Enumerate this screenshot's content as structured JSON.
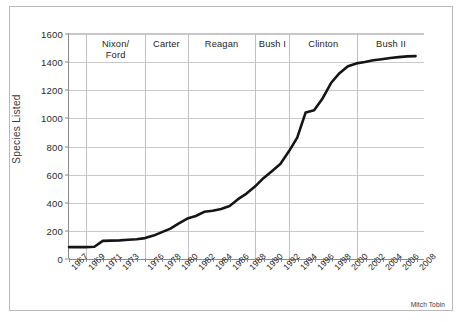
{
  "credit": "Mitch Tobin",
  "chart_data": {
    "type": "line",
    "title": "",
    "xlabel": "",
    "ylabel": "Species Listed",
    "ylim": [
      0,
      1600
    ],
    "ytick_labels": [
      "0",
      "200",
      "400",
      "600",
      "800",
      "1000",
      "1200",
      "1400",
      "1600"
    ],
    "ytick_values": [
      0,
      200,
      400,
      600,
      800,
      1000,
      1200,
      1400,
      1600
    ],
    "xtick_labels": [
      "1967",
      "1969",
      "1971",
      "1973",
      "1976",
      "1978",
      "1980",
      "1982",
      "1984",
      "1986",
      "1988",
      "1990",
      "1992",
      "1994",
      "1996",
      "1998",
      "2000",
      "2002",
      "2004",
      "2006",
      "2008"
    ],
    "grid": true,
    "legend": "none",
    "line_color": "#151515",
    "x": [
      1967,
      1968,
      1969,
      1970,
      1971,
      1972,
      1973,
      1974,
      1975,
      1976,
      1977,
      1978,
      1979,
      1980,
      1981,
      1982,
      1983,
      1984,
      1985,
      1986,
      1987,
      1988,
      1989,
      1990,
      1991,
      1992,
      1993,
      1994,
      1995,
      1996,
      1997,
      1998,
      1999,
      2000,
      2001,
      2002,
      2003,
      2004,
      2005,
      2006,
      2007,
      2008
    ],
    "values": [
      78,
      78,
      78,
      80,
      122,
      124,
      126,
      130,
      134,
      142,
      160,
      185,
      210,
      248,
      282,
      300,
      330,
      338,
      350,
      372,
      420,
      460,
      510,
      570,
      620,
      672,
      760,
      860,
      1040,
      1055,
      1140,
      1250,
      1320,
      1370,
      1390,
      1400,
      1412,
      1420,
      1428,
      1435,
      1440,
      1442
    ],
    "era_bands": [
      {
        "label": "Nixon/\nFord",
        "start": 1969,
        "end": 1976
      },
      {
        "label": "Carter",
        "start": 1976,
        "end": 1981
      },
      {
        "label": "Reagan",
        "start": 1981,
        "end": 1989
      },
      {
        "label": "Bush I",
        "start": 1989,
        "end": 1993
      },
      {
        "label": "Clinton",
        "start": 1993,
        "end": 2001
      },
      {
        "label": "Bush II",
        "start": 2001,
        "end": 2009
      }
    ]
  }
}
